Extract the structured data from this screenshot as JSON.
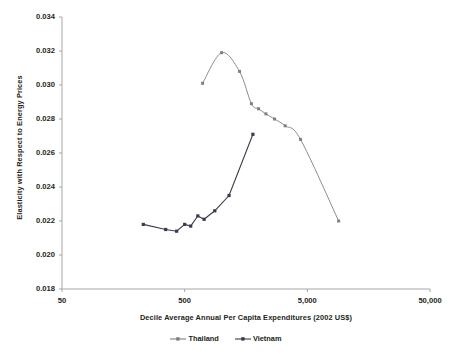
{
  "chart_data": {
    "type": "line",
    "title": "",
    "xlabel": "Decile Average Annual Per Capita Expenditures (2002 US$)",
    "ylabel": "Elasticity with Respect to Energy Prices",
    "x_scale": "log",
    "xlim": [
      50,
      50000
    ],
    "ylim": [
      0.018,
      0.034
    ],
    "grid": false,
    "legend_position": "bottom",
    "x_ticks": [
      "50",
      "500",
      "5,000",
      "50,000"
    ],
    "x_tick_values": [
      50,
      500,
      5000,
      50000
    ],
    "y_ticks": [
      "0.018",
      "0.020",
      "0.022",
      "0.024",
      "0.026",
      "0.028",
      "0.030",
      "0.032",
      "0.034"
    ],
    "y_tick_values": [
      0.018,
      0.02,
      0.022,
      0.024,
      0.026,
      0.028,
      0.03,
      0.032,
      0.034
    ],
    "series": [
      {
        "name": "Thailand",
        "color": "#7f7f7f",
        "marker": "square",
        "x": [
          700,
          1000,
          1400,
          1750,
          2000,
          2300,
          2700,
          3300,
          4400,
          9000
        ],
        "y": [
          0.0301,
          0.0319,
          0.0308,
          0.0289,
          0.0286,
          0.0283,
          0.028,
          0.0276,
          0.0268,
          0.022
        ]
      },
      {
        "name": "Vietnam",
        "color": "#3b3b4f",
        "marker": "square",
        "x": [
          230,
          350,
          430,
          500,
          560,
          640,
          720,
          880,
          1150,
          1800
        ],
        "y": [
          0.0218,
          0.0215,
          0.0214,
          0.0218,
          0.0217,
          0.0223,
          0.0221,
          0.0226,
          0.0235,
          0.0271
        ]
      }
    ]
  },
  "legend": {
    "items": [
      {
        "label": "Thailand",
        "color": "#7f7f7f"
      },
      {
        "label": "Vietnam",
        "color": "#3b3b4f"
      }
    ]
  },
  "axes": {
    "x_title": "Decile Average Annual Per Capita Expenditures (2002 US$)",
    "y_title": "Elasticity with Respect to Energy Prices"
  }
}
